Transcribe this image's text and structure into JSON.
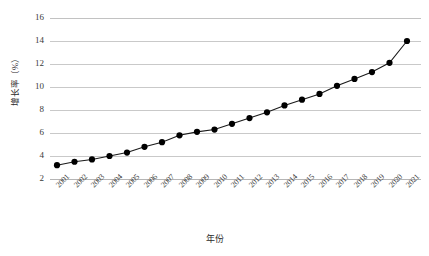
{
  "chart_data": {
    "type": "line",
    "title": "",
    "subtitle": "",
    "xlabel": "年份",
    "ylabel": "增长率（%）",
    "xlim": [
      "2001",
      "2021"
    ],
    "ylim": [
      2,
      16
    ],
    "ytick_step": 2,
    "grid": true,
    "legend": "none",
    "marker": "filled-circle",
    "line_color": "#1a1a1a",
    "marker_color": "#000000",
    "grid_color": "#c9c9c9",
    "categories": [
      "2001",
      "2002",
      "2003",
      "2004",
      "2005",
      "2006",
      "2007",
      "2008",
      "2009",
      "2010",
      "2011",
      "2012",
      "2013",
      "2014",
      "2015",
      "2016",
      "2017",
      "2018",
      "2019",
      "2020",
      "2021"
    ],
    "values": [
      3.2,
      3.5,
      3.7,
      4.0,
      4.3,
      4.8,
      5.2,
      5.8,
      6.1,
      6.3,
      6.8,
      7.3,
      7.8,
      8.4,
      8.9,
      9.4,
      10.1,
      10.7,
      11.3,
      12.1,
      14.0
    ],
    "ytick_labels": [
      "16",
      "14",
      "12",
      "10",
      "8",
      "6",
      "4",
      "2"
    ],
    "ytick_values": [
      16,
      14,
      12,
      10,
      8,
      6,
      4,
      2
    ]
  }
}
